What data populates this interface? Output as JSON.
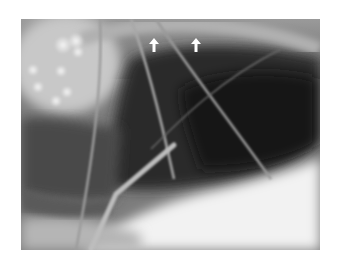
{
  "figure": {
    "type": "radiograph",
    "annotations": [
      {
        "type": "arrow",
        "direction": "up",
        "color": "#ffffff",
        "x": 154,
        "y": 45
      },
      {
        "type": "arrow",
        "direction": "up",
        "color": "#ffffff",
        "x": 196,
        "y": 45
      }
    ],
    "colors": {
      "background": "#ffffff",
      "lung_dark": "#1e1e1e",
      "soft_tissue": "#8a8a8a",
      "bright_region": "#f2f2f2"
    }
  }
}
